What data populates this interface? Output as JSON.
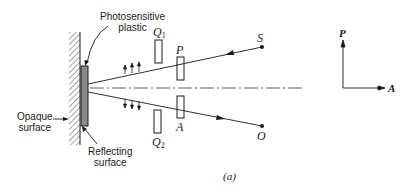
{
  "figure": {
    "caption": "(a)",
    "labels": {
      "photosensitive_plastic": [
        "Photosensitive",
        "plastic"
      ],
      "opaque_surface": [
        "Opaque",
        "surface"
      ],
      "reflecting_surface": [
        "Reflecting",
        "surface"
      ],
      "source": "S",
      "observer": "O",
      "polarizer": "P",
      "analyzer": "A",
      "quarter_wave_1": {
        "letter": "Q",
        "sub": "1"
      },
      "quarter_wave_2": {
        "letter": "Q",
        "sub": "2"
      },
      "axis_p": "P",
      "axis_a": "A"
    },
    "colors": {
      "line": "#1a1a1a",
      "plastic_fill": "#8a8a8a",
      "background": "#ffffff"
    }
  }
}
